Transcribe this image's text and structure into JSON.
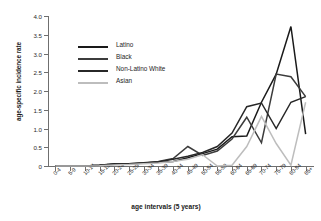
{
  "chart_data": {
    "type": "line",
    "title": "",
    "xlabel": "age intervals (5 years)",
    "ylabel": "age-specific incidence rate",
    "ylim": [
      0,
      4.0
    ],
    "yticks": [
      "0",
      "0.5",
      "1.0",
      "1.5",
      "2.0",
      "2.5",
      "3.0",
      "3.5",
      "4.0"
    ],
    "ytick_values": [
      0,
      0.5,
      1.0,
      1.5,
      2.0,
      2.5,
      3.0,
      3.5,
      4.0
    ],
    "grid": false,
    "legend_position": "upper-left-inside",
    "categories": [
      "0-4",
      "5-9",
      "10-14",
      "15-19",
      "20-24",
      "25-29",
      "30-34",
      "35-39",
      "40-44",
      "45-49",
      "50-54",
      "55-59",
      "60-64",
      "65-69",
      "70-74",
      "75-79",
      "80-84",
      "85+"
    ],
    "series": [
      {
        "name": "Latino",
        "color": "#1a1a1a",
        "width": 1.5,
        "values": [
          0,
          0,
          0,
          0.02,
          0.06,
          0.05,
          0.08,
          0.1,
          0.12,
          0.22,
          0.33,
          0.45,
          0.78,
          0.8,
          1.7,
          2.45,
          3.72,
          0.85
        ]
      },
      {
        "name": "Black",
        "color": "#3c3c3c",
        "width": 1.5,
        "values": [
          0,
          0,
          0,
          0.02,
          0.05,
          0.06,
          0.09,
          0.12,
          0.2,
          0.52,
          0.28,
          0.4,
          0.72,
          1.3,
          0.62,
          2.45,
          2.38,
          1.85
        ]
      },
      {
        "name": "Non-Latino White",
        "color": "#272727",
        "width": 1.5,
        "values": [
          0,
          0,
          0,
          0.02,
          0.05,
          0.06,
          0.08,
          0.11,
          0.18,
          0.26,
          0.36,
          0.52,
          0.88,
          1.58,
          1.68,
          1.0,
          1.7,
          1.85
        ]
      },
      {
        "name": "Asian",
        "color": "#bdbdbd",
        "width": 1.5,
        "values": [
          0,
          0,
          0,
          0.01,
          0.03,
          0.04,
          0.06,
          0.08,
          0.12,
          0.18,
          0.3,
          0.0,
          0.02,
          0.52,
          1.32,
          0.6,
          0.02,
          1.7
        ]
      }
    ]
  },
  "legend": {
    "items": [
      {
        "label": "Latino"
      },
      {
        "label": "Black"
      },
      {
        "label": "Non-Latino White"
      },
      {
        "label": "Asian"
      }
    ]
  }
}
